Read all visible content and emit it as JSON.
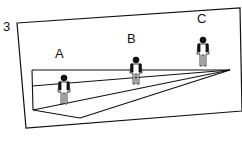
{
  "figure": {
    "panel_number": "3",
    "labels": {
      "a": "A",
      "b": "B",
      "c": "C"
    },
    "colors": {
      "ink": "#111111",
      "background": "#ffffff"
    }
  }
}
